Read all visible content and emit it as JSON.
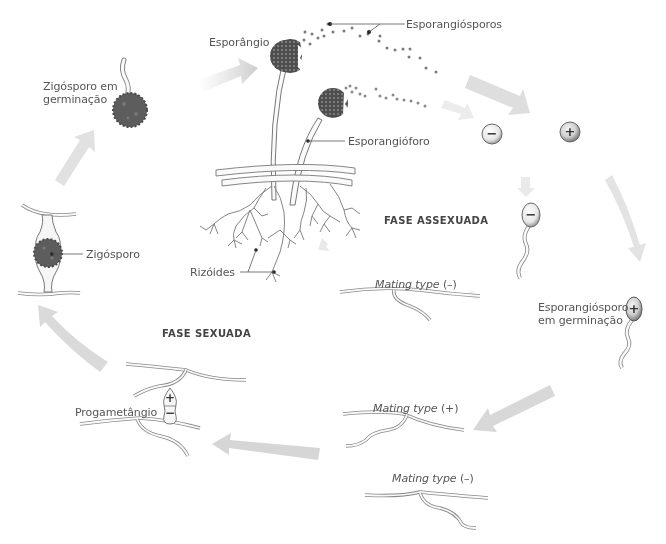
{
  "diagram": {
    "phases": {
      "asexual": "FASE ASSEXUADA",
      "sexual": "FASE SEXUADA"
    },
    "labels": {
      "sporangium": "Esporângio",
      "sporangiospores": "Esporangiósporos",
      "sporangiophore": "Esporangióforo",
      "rhizoids": "Rizóides",
      "zygospore_germinating_l1": "Zigósporo em",
      "zygospore_germinating_l2": "germinação",
      "zygospore": "Zigósporo",
      "sporangiospore_germinating_l1": "Esporangiósporo",
      "sporangiospore_germinating_l2": "em germinação",
      "progametangium": "Progametângio",
      "mating_minus_top_text": "Mating type",
      "mating_minus_top_sign": " (–)",
      "mating_plus_text": "Mating type",
      "mating_plus_sign": " (+)",
      "mating_minus_bottom_text": "Mating type",
      "mating_minus_bottom_sign": " (–)"
    },
    "symbols": {
      "minus": "−",
      "plus": "+"
    },
    "nodes": [
      {
        "id": "zygospore-germinating",
        "label": "Zigósporo em germinação"
      },
      {
        "id": "sporangium",
        "label": "Esporângio"
      },
      {
        "id": "spores-minus-plus",
        "label": "(−) (+)"
      },
      {
        "id": "spore-germinating-minus",
        "label": "(−)"
      },
      {
        "id": "spore-germinating-plus",
        "label": "Esporangiósporo em germinação (+)"
      },
      {
        "id": "mating-minus-top",
        "label": "Mating type (–)"
      },
      {
        "id": "mating-plus",
        "label": "Mating type (+)"
      },
      {
        "id": "mating-minus-bottom",
        "label": "Mating type (–)"
      },
      {
        "id": "progametangium",
        "label": "Progametângio (+)(−)"
      },
      {
        "id": "zygospore",
        "label": "Zigósporo"
      }
    ],
    "colors": {
      "arrow": "#c8c8c8",
      "spore_fill": "#5a5a5a",
      "line": "#777777",
      "hypha_fill": "#f7f7f7",
      "text": "#555555"
    }
  }
}
